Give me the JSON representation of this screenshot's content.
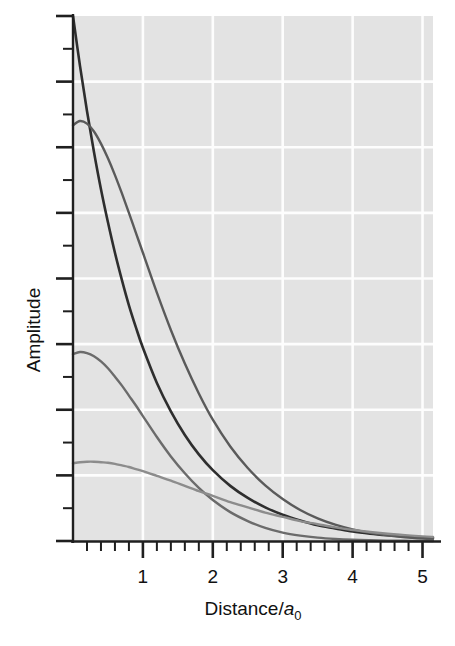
{
  "figure": {
    "background_color": "#ffffff",
    "plot_background_color": "#e3e3e3",
    "grid_color": "#fdfdfd",
    "axis_color": "#1f1f1f"
  },
  "axes": {
    "x": {
      "label_main": "Distance/",
      "label_italic": "a",
      "label_sub": "0",
      "label_full": "Distance/a0",
      "ticks": [
        "1",
        "2",
        "3",
        "4",
        "5"
      ],
      "tick_values": [
        1,
        2,
        3,
        4,
        5
      ],
      "minor_tick_step": 0.2,
      "range": [
        0,
        5.15
      ]
    },
    "y": {
      "label": "Amplitude",
      "ticks": [],
      "major_tick_count": 8,
      "minor_tick_count": 16,
      "range": [
        0,
        1.0
      ]
    }
  },
  "chart_data": {
    "type": "line",
    "title": "",
    "xlabel": "Distance/a0",
    "ylabel": "Amplitude",
    "xlim": [
      0,
      5.15
    ],
    "ylim": [
      0,
      1.0
    ],
    "grid": true,
    "legend_position": "none",
    "x": [
      0,
      0.1,
      0.2,
      0.3,
      0.4,
      0.5,
      0.6,
      0.7,
      0.8,
      0.9,
      1.0,
      1.2,
      1.4,
      1.6,
      1.8,
      2.0,
      2.25,
      2.5,
      2.75,
      3.0,
      3.25,
      3.5,
      3.75,
      4.0,
      4.25,
      4.5,
      4.75,
      5.0,
      5.15
    ],
    "series": [
      {
        "name": "curve-1",
        "color": "#2e2e2e",
        "width": 2.6,
        "values": [
          1.0,
          0.905,
          0.819,
          0.741,
          0.67,
          0.607,
          0.549,
          0.497,
          0.449,
          0.407,
          0.368,
          0.301,
          0.247,
          0.202,
          0.165,
          0.135,
          0.105,
          0.082,
          0.064,
          0.05,
          0.039,
          0.03,
          0.024,
          0.018,
          0.014,
          0.011,
          0.0086,
          0.0067,
          0.0059
        ]
      },
      {
        "name": "curve-2",
        "color": "#5a5a5a",
        "width": 2.4,
        "values": [
          0.792,
          0.8,
          0.795,
          0.78,
          0.757,
          0.729,
          0.697,
          0.662,
          0.625,
          0.587,
          0.549,
          0.473,
          0.402,
          0.338,
          0.281,
          0.231,
          0.18,
          0.139,
          0.106,
          0.08,
          0.059,
          0.043,
          0.031,
          0.022,
          0.0154,
          0.0106,
          0.0072,
          0.0048,
          0.0038
        ]
      },
      {
        "name": "curve-3",
        "color": "#6b6b6b",
        "width": 2.4,
        "values": [
          0.356,
          0.36,
          0.358,
          0.352,
          0.342,
          0.329,
          0.313,
          0.296,
          0.277,
          0.258,
          0.238,
          0.198,
          0.161,
          0.129,
          0.101,
          0.078,
          0.055,
          0.038,
          0.025,
          0.016,
          0.0103,
          0.0064,
          0.0039,
          0.0023,
          0.0014,
          0.0008,
          0.0004,
          0.0002,
          0.0001
        ]
      },
      {
        "name": "curve-4",
        "color": "#8c8c8c",
        "width": 2.4,
        "values": [
          0.148,
          0.15,
          0.151,
          0.151,
          0.15,
          0.149,
          0.147,
          0.144,
          0.141,
          0.137,
          0.133,
          0.124,
          0.115,
          0.105,
          0.095,
          0.086,
          0.074,
          0.064,
          0.054,
          0.046,
          0.038,
          0.032,
          0.026,
          0.021,
          0.0172,
          0.0139,
          0.0111,
          0.0088,
          0.0078
        ]
      }
    ]
  }
}
